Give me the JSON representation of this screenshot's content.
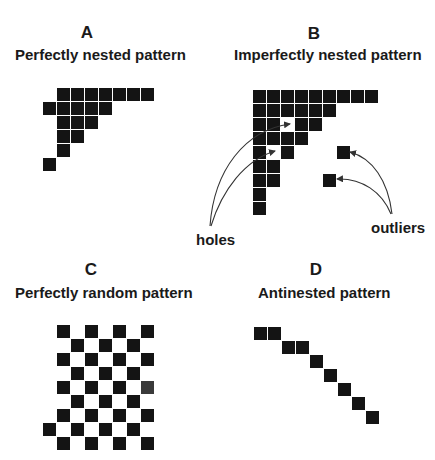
{
  "figure": {
    "panels": [
      {
        "id": "A",
        "letter": "A",
        "title": "Perfectly nested pattern",
        "origin": [
          43,
          88
        ],
        "cells": [
          [
            0,
            1
          ],
          [
            0,
            2
          ],
          [
            0,
            3
          ],
          [
            0,
            4
          ],
          [
            0,
            5
          ],
          [
            0,
            6
          ],
          [
            0,
            7
          ],
          [
            1,
            0
          ],
          [
            1,
            1
          ],
          [
            1,
            2
          ],
          [
            1,
            3
          ],
          [
            1,
            4
          ],
          [
            2,
            1
          ],
          [
            2,
            2
          ],
          [
            2,
            3
          ],
          [
            3,
            1
          ],
          [
            3,
            2
          ],
          [
            4,
            1
          ],
          [
            5,
            0
          ]
        ]
      },
      {
        "id": "B",
        "letter": "B",
        "title": "Imperfectly  nested pattern",
        "origin": [
          253,
          90
        ],
        "cells": [
          [
            0,
            0
          ],
          [
            0,
            1
          ],
          [
            0,
            2
          ],
          [
            0,
            3
          ],
          [
            0,
            4
          ],
          [
            0,
            5
          ],
          [
            0,
            6
          ],
          [
            0,
            7
          ],
          [
            0,
            8
          ],
          [
            1,
            0
          ],
          [
            1,
            1
          ],
          [
            1,
            2
          ],
          [
            1,
            3
          ],
          [
            1,
            4
          ],
          [
            1,
            5
          ],
          [
            2,
            0
          ],
          [
            2,
            1
          ],
          [
            2,
            3
          ],
          [
            2,
            4
          ],
          [
            3,
            0
          ],
          [
            3,
            1
          ],
          [
            3,
            2
          ],
          [
            3,
            3
          ],
          [
            4,
            0
          ],
          [
            4,
            2
          ],
          [
            5,
            0
          ],
          [
            5,
            1
          ],
          [
            6,
            0
          ],
          [
            6,
            1
          ],
          [
            7,
            0
          ],
          [
            8,
            0
          ]
        ],
        "outlier_cells": [
          [
            4,
            6
          ],
          [
            6,
            5
          ]
        ],
        "annotations": {
          "holes_label": "holes",
          "outliers_label": "outliers"
        }
      },
      {
        "id": "C",
        "letter": "C",
        "title": "Perfectly random pattern",
        "origin": [
          43,
          325
        ],
        "cells": [
          [
            0,
            1
          ],
          [
            0,
            3
          ],
          [
            0,
            5
          ],
          [
            0,
            7
          ],
          [
            1,
            2
          ],
          [
            1,
            4
          ],
          [
            1,
            6
          ],
          [
            2,
            1
          ],
          [
            2,
            3
          ],
          [
            2,
            5
          ],
          [
            2,
            7
          ],
          [
            3,
            2
          ],
          [
            3,
            4
          ],
          [
            3,
            6
          ],
          [
            4,
            1
          ],
          [
            4,
            3
          ],
          [
            4,
            5
          ],
          [
            4,
            7
          ],
          [
            5,
            2
          ],
          [
            5,
            4
          ],
          [
            5,
            6
          ],
          [
            6,
            1
          ],
          [
            6,
            3
          ],
          [
            6,
            5
          ],
          [
            6,
            7
          ],
          [
            7,
            0
          ],
          [
            7,
            2
          ],
          [
            7,
            4
          ],
          [
            7,
            6
          ],
          [
            8,
            1
          ],
          [
            8,
            3
          ],
          [
            8,
            5
          ],
          [
            8,
            7
          ]
        ],
        "light_cells": [
          [
            4,
            7
          ]
        ]
      },
      {
        "id": "D",
        "letter": "D",
        "title": "Antinested pattern",
        "origin": [
          254,
          327
        ],
        "cells": [
          [
            0,
            0
          ],
          [
            0,
            1
          ],
          [
            1,
            2
          ],
          [
            1,
            3
          ],
          [
            2,
            4
          ],
          [
            3,
            5
          ],
          [
            4,
            6
          ],
          [
            5,
            7
          ],
          [
            6,
            8
          ]
        ]
      }
    ],
    "cell_pitch_px": 14,
    "cell_size_px": 13,
    "colors": {
      "cell": "#141414",
      "cell_light": "#3a3a3a",
      "text": "#1a1a1a",
      "arrow": "#333333"
    }
  }
}
